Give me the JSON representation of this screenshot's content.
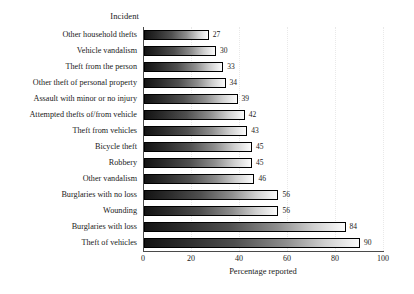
{
  "chart_data": {
    "type": "bar",
    "orientation": "horizontal",
    "title": "",
    "xlabel": "Percentage reported",
    "ylabel": "Incident",
    "xlim": [
      0,
      100
    ],
    "xticks": [
      0,
      20,
      40,
      60,
      80,
      100
    ],
    "grid": true,
    "legend": null,
    "categories": [
      "Other household thefts",
      "Vehicle vandalism",
      "Theft from the person",
      "Other theft of personal property",
      "Assault with minor or no injury",
      "Attempted thefts of/from vehicle",
      "Theft from vehicles",
      "Bicycle theft",
      "Robbery",
      "Other vandalism",
      "Burglaries with no loss",
      "Wounding",
      "Burglaries with loss",
      "Theft of vehicles"
    ],
    "values": [
      27,
      30,
      33,
      34,
      39,
      42,
      43,
      45,
      45,
      46,
      56,
      56,
      84,
      90
    ],
    "value_labels": [
      "27",
      "30",
      "33",
      "34",
      "39",
      "42",
      "43",
      "45",
      "45",
      "46",
      "56",
      "56",
      "84",
      "90"
    ],
    "bar_fill": "gradient-dark-to-light",
    "bar_outline": "#000000",
    "background": "#ffffff"
  }
}
